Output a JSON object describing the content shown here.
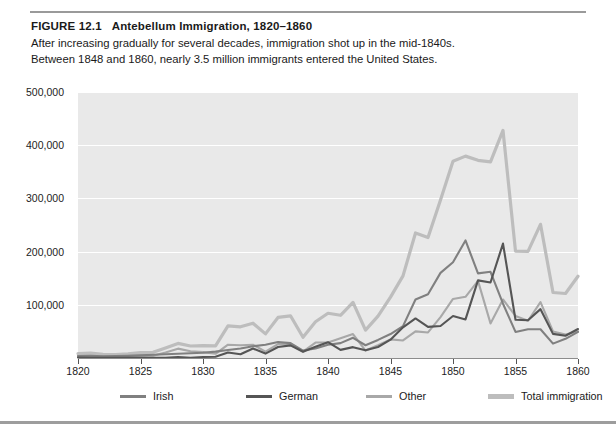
{
  "figure": {
    "number": "FIGURE 12.1",
    "title": "Antebellum Immigration, 1820–1860",
    "description": "After increasing gradually for several decades, immigration shot up in the mid-1840s. Between 1848 and 1860, nearly 3.5 million immigrants entered the United States."
  },
  "colors": {
    "plot_background": "#e9e9e9",
    "gridline": "#ffffff",
    "irish": "#808080",
    "german": "#555555",
    "other": "#a8a8a8",
    "total": "#bdbdbd",
    "axis": "#8c8c8c"
  },
  "chart_data": {
    "type": "line",
    "title": "Antebellum Immigration, 1820–1860",
    "xlabel": "",
    "ylabel": "",
    "xlim": [
      1820,
      1860
    ],
    "ylim": [
      0,
      500000
    ],
    "grid": true,
    "legend_position": "bottom",
    "xticks": [
      1820,
      1825,
      1830,
      1835,
      1840,
      1845,
      1850,
      1855,
      1860
    ],
    "yticks": [
      100000,
      200000,
      300000,
      400000,
      500000
    ],
    "ytick_labels": [
      "100,000",
      "200,000",
      "300,000",
      "400,000",
      "500,000"
    ],
    "x": [
      1820,
      1821,
      1822,
      1823,
      1824,
      1825,
      1826,
      1827,
      1828,
      1829,
      1830,
      1831,
      1832,
      1833,
      1834,
      1835,
      1836,
      1837,
      1838,
      1839,
      1840,
      1841,
      1842,
      1843,
      1844,
      1845,
      1846,
      1847,
      1848,
      1849,
      1850,
      1851,
      1852,
      1853,
      1854,
      1855,
      1856,
      1857,
      1858,
      1859,
      1860
    ],
    "series": [
      {
        "name": "Irish",
        "color": "#808080",
        "values": [
          3600,
          4000,
          3000,
          3500,
          4000,
          5000,
          6000,
          7000,
          8000,
          9000,
          10000,
          12000,
          15000,
          18000,
          22000,
          25000,
          30000,
          28000,
          14000,
          18000,
          25000,
          28000,
          38000,
          24000,
          34000,
          45000,
          60000,
          110000,
          120000,
          160000,
          180000,
          221000,
          159000,
          162000,
          102000,
          49000,
          54000,
          54000,
          27000,
          36000,
          49000
        ]
      },
      {
        "name": "German",
        "color": "#555555",
        "values": [
          950,
          400,
          150,
          200,
          250,
          450,
          500,
          430,
          1850,
          600,
          1980,
          2400,
          10200,
          6990,
          17700,
          8310,
          20700,
          23700,
          11700,
          21000,
          29700,
          15300,
          20400,
          14400,
          20700,
          34400,
          57600,
          74300,
          58500,
          60200,
          78900,
          72500,
          145900,
          141900,
          215000,
          71900,
          71000,
          91800,
          45300,
          41800,
          54500
        ]
      },
      {
        "name": "Other",
        "color": "#a8a8a8",
        "values": [
          3500,
          3700,
          3200,
          2400,
          3800,
          4900,
          4400,
          10500,
          17600,
          12700,
          11000,
          7900,
          25000,
          24000,
          25000,
          12000,
          26000,
          27000,
          12000,
          29000,
          29000,
          37000,
          45000,
          14000,
          24000,
          35000,
          33000,
          50000,
          48000,
          77000,
          111000,
          115000,
          145000,
          65000,
          110000,
          79000,
          70000,
          105000,
          50000,
          44000,
          50000
        ]
      },
      {
        "name": "Total immigration",
        "color": "#bdbdbd",
        "values": [
          8385,
          9127,
          6911,
          6354,
          7912,
          10199,
          10837,
          18875,
          27382,
          22520,
          23322,
          22633,
          60482,
          58640,
          65365,
          45374,
          76242,
          79340,
          38914,
          68069,
          84066,
          80289,
          104565,
          52496,
          78615,
          114371,
          154416,
          234968,
          226527,
          297024,
          369980,
          379466,
          371603,
          368645,
          427833,
          200877,
          200436,
          251306,
          123126,
          121282,
          153640
        ]
      }
    ]
  },
  "legend": {
    "items": [
      {
        "label": "Irish",
        "color": "#808080"
      },
      {
        "label": "German",
        "color": "#555555"
      },
      {
        "label": "Other",
        "color": "#a8a8a8"
      },
      {
        "label": "Total immigration",
        "color": "#bdbdbd"
      }
    ]
  }
}
